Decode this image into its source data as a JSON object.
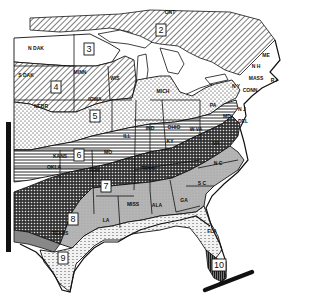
{
  "map": {
    "title": "",
    "zones": [
      {
        "number": "2",
        "x": 161,
        "y": 30
      },
      {
        "number": "3",
        "x": 89,
        "y": 49
      },
      {
        "number": "4",
        "x": 56,
        "y": 87
      },
      {
        "number": "5",
        "x": 95,
        "y": 116
      },
      {
        "number": "6",
        "x": 79,
        "y": 155
      },
      {
        "number": "7",
        "x": 106,
        "y": 186
      },
      {
        "number": "8",
        "x": 73,
        "y": 219
      },
      {
        "number": "9",
        "x": 63,
        "y": 258
      },
      {
        "number": "10",
        "x": 219,
        "y": 265
      }
    ],
    "state_labels": [
      {
        "text": "ONT",
        "x": 170,
        "y": 14
      },
      {
        "text": "N DAK",
        "x": 36,
        "y": 50
      },
      {
        "text": "S DAK",
        "x": 26,
        "y": 77
      },
      {
        "text": "NEBR",
        "x": 41,
        "y": 108
      },
      {
        "text": "MINN",
        "x": 80,
        "y": 74
      },
      {
        "text": "WIS",
        "x": 115,
        "y": 80
      },
      {
        "text": "IOWA",
        "x": 95,
        "y": 101
      },
      {
        "text": "MICH",
        "x": 163,
        "y": 93
      },
      {
        "text": "ILL",
        "x": 127,
        "y": 138
      },
      {
        "text": "IND",
        "x": 150,
        "y": 130
      },
      {
        "text": "OHIO",
        "x": 174,
        "y": 129
      },
      {
        "text": "PA",
        "x": 213,
        "y": 107
      },
      {
        "text": "N Y",
        "x": 236,
        "y": 88
      },
      {
        "text": "ME",
        "x": 266,
        "y": 57
      },
      {
        "text": "N H",
        "x": 256,
        "y": 68
      },
      {
        "text": "MASS",
        "x": 256,
        "y": 80
      },
      {
        "text": "R I",
        "x": 274,
        "y": 82
      },
      {
        "text": "CONN",
        "x": 250,
        "y": 92
      },
      {
        "text": "N J",
        "x": 242,
        "y": 111
      },
      {
        "text": "DEL",
        "x": 243,
        "y": 123
      },
      {
        "text": "MD",
        "x": 227,
        "y": 118
      },
      {
        "text": "W VA",
        "x": 196,
        "y": 131
      },
      {
        "text": "VA",
        "x": 216,
        "y": 145
      },
      {
        "text": "KY",
        "x": 170,
        "y": 143
      },
      {
        "text": "TENN",
        "x": 148,
        "y": 170
      },
      {
        "text": "MO",
        "x": 108,
        "y": 154
      },
      {
        "text": "KANS",
        "x": 60,
        "y": 158
      },
      {
        "text": "OKLA",
        "x": 54,
        "y": 169
      },
      {
        "text": "ARK",
        "x": 95,
        "y": 172
      },
      {
        "text": "N C",
        "x": 218,
        "y": 165
      },
      {
        "text": "S C",
        "x": 202,
        "y": 185
      },
      {
        "text": "GA",
        "x": 184,
        "y": 202
      },
      {
        "text": "ALA",
        "x": 157,
        "y": 207
      },
      {
        "text": "MISS",
        "x": 133,
        "y": 206
      },
      {
        "text": "LA",
        "x": 106,
        "y": 222
      },
      {
        "text": "TEXAS",
        "x": 60,
        "y": 235
      },
      {
        "text": "FLA",
        "x": 212,
        "y": 233
      }
    ],
    "colors": {
      "ink": "#111111",
      "paper": "#ffffff",
      "light_gray": "#c9c9c9",
      "mid_gray": "#a8a8a8",
      "dark_gray": "#5a5a5a"
    }
  }
}
